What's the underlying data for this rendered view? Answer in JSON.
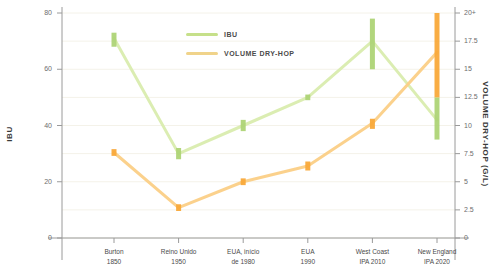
{
  "chart_data": {
    "type": "line",
    "title": "",
    "xlabel": "",
    "categories": [
      "Burton\n1850",
      "Reino Unido\n1950",
      "EUA, início\nde 1980",
      "EUA\n1990",
      "West Coast\nIPA 2010",
      "New England\nIPA 2020"
    ],
    "category_lines": [
      [
        "Burton",
        "1850"
      ],
      [
        "Reino Unido",
        "1950"
      ],
      [
        "EUA, início",
        "de 1980"
      ],
      [
        "EUA",
        "1990"
      ],
      [
        "West Coast",
        "IPA 2010"
      ],
      [
        "New England",
        "IPA 2020"
      ]
    ],
    "grid": true,
    "legend_position": "top-center",
    "axes": {
      "left": {
        "label": "IBU",
        "ticks": [
          0,
          20,
          40,
          60,
          80
        ],
        "tick_labels": [
          "0",
          "20",
          "40",
          "60",
          "80"
        ],
        "ylim": [
          0,
          80
        ]
      },
      "right": {
        "label": "VOLUME DRY-HOP (G/L)",
        "ticks": [
          0,
          2.5,
          5,
          7.5,
          10,
          12.5,
          15,
          17.5,
          20
        ],
        "tick_labels": [
          "0",
          "2.5",
          "5",
          "7.5",
          "10",
          "12.5",
          "15",
          "17.5",
          "20+"
        ],
        "ylim": [
          0,
          20
        ]
      }
    },
    "series": [
      {
        "name": "IBU",
        "axis": "left",
        "color": "#c6e08a",
        "unit": "IBU",
        "values": [
          71,
          30,
          40,
          50,
          70,
          42
        ],
        "ranges": [
          [
            68,
            73
          ],
          [
            28,
            32
          ],
          [
            38,
            42
          ],
          [
            49,
            51
          ],
          [
            60,
            78
          ],
          [
            35,
            50
          ]
        ]
      },
      {
        "name": "VOLUME DRY-HOP",
        "axis": "right",
        "color": "#f9b949",
        "unit": "g/L",
        "values": [
          7.6,
          2.7,
          5.0,
          6.4,
          10.2,
          16.5
        ],
        "ranges": [
          [
            7.3,
            7.9
          ],
          [
            2.4,
            3.0
          ],
          [
            4.7,
            5.3
          ],
          [
            6.0,
            6.8
          ],
          [
            9.7,
            10.6
          ],
          [
            12.5,
            20.0
          ]
        ]
      }
    ]
  },
  "legend": {
    "items": [
      {
        "label": "IBU",
        "color": "#c6e08a"
      },
      {
        "label": "VOLUME DRY-HOP",
        "color": "#f0d38a"
      }
    ]
  },
  "colors": {
    "ibu_line": "#d9ecae",
    "ibu_marker": "#aed477",
    "dryhop_line": "#fbcf86",
    "dryhop_marker": "#f9a93a",
    "axis": "#9a9a9a",
    "grid": "#f4f2e9",
    "text": "#4a4a4a"
  }
}
